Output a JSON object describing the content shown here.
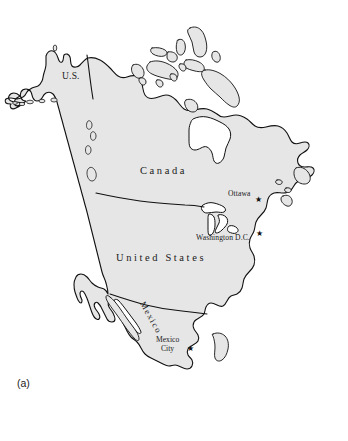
{
  "figure": {
    "caption": "(a)",
    "background_color": "#ffffff",
    "land_fill_color": "#e6e6e6",
    "outline_color": "#111111",
    "water_fill_color": "#ffffff"
  },
  "map": {
    "title": "North America",
    "projection_note": "continental outline map",
    "country_labels": [
      {
        "name": "us-alaska",
        "text": "U.S.",
        "x": 62,
        "y": 78
      },
      {
        "name": "canada",
        "text": "Canada",
        "x": 140,
        "y": 172
      },
      {
        "name": "united-states",
        "text": "United States",
        "x": 133,
        "y": 258
      },
      {
        "name": "mexico",
        "text": "Mexico",
        "x": 148,
        "y": 305
      }
    ],
    "city_labels": [
      {
        "name": "ottawa",
        "text": "Ottawa",
        "x": 228,
        "y": 194,
        "star_x": 255,
        "star_y": 200
      },
      {
        "name": "washington-dc",
        "text": "Washington D.C.",
        "x": 196,
        "y": 238,
        "star_x": 257,
        "star_y": 234
      },
      {
        "name": "mexico-city",
        "line1": "Mexico",
        "line2": "City",
        "x": 160,
        "y": 340,
        "star_x": 188,
        "star_y": 349
      }
    ],
    "markers": {
      "capital_star_glyph": "★"
    },
    "borders": [
      {
        "name": "us-canada-border",
        "description": "49th parallel land border"
      },
      {
        "name": "us-mexico-border",
        "description": "southern United States border"
      }
    ],
    "water_bodies": [
      {
        "name": "hudson-bay"
      },
      {
        "name": "great-lakes"
      },
      {
        "name": "gulf-of-california"
      },
      {
        "name": "gulf-of-st-lawrence"
      }
    ]
  }
}
